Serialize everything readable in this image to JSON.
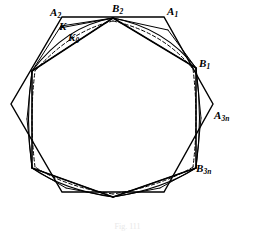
{
  "figure": {
    "caption": "Fig. 111",
    "background_color": "#ffffff",
    "stroke_color": "#000000",
    "labels": [
      {
        "id": "A2",
        "base": "A",
        "sub": "2",
        "x": 50,
        "y": 7,
        "name": "label-a2"
      },
      {
        "id": "B2",
        "base": "B",
        "sub": "2",
        "x": 112,
        "y": 3,
        "name": "label-b2"
      },
      {
        "id": "A1",
        "base": "A",
        "sub": "1",
        "x": 167,
        "y": 6,
        "name": "label-a1"
      },
      {
        "id": "K",
        "base": "K",
        "sub": "",
        "x": 59,
        "y": 21,
        "name": "label-k"
      },
      {
        "id": "K0",
        "base": "K",
        "sub": "0",
        "x": 68,
        "y": 32,
        "name": "label-k0"
      },
      {
        "id": "B1",
        "base": "B",
        "sub": "1",
        "x": 199,
        "y": 58,
        "name": "label-b1"
      },
      {
        "id": "A3n",
        "base": "A",
        "sub": "3n",
        "x": 214,
        "y": 110,
        "name": "label-a3n"
      },
      {
        "id": "B3n",
        "base": "B",
        "sub": "3n",
        "x": 196,
        "y": 163,
        "name": "label-b3n"
      }
    ],
    "outer_hexagon": {
      "name": "outer-hexagon-A",
      "points": "62,17 164,17 213,104 164,192 62,192 11,104",
      "stroke_width": 1.4
    },
    "inner_hexagon": {
      "name": "inner-hexagon-B",
      "points": "113,18 196,68 196,168 113,197 32,168 32,71",
      "stroke_width": 1.6
    },
    "arcs_outer": {
      "name": "curve-K",
      "stroke_width": 1.1,
      "paths": [
        "M113,18 Q66,26 32,71",
        "M113,18 Q165,28 196,68",
        "M196,68 Q203,118 196,168",
        "M196,168 Q163,189 113,197",
        "M113,197 Q64,190 32,168",
        "M32,168 Q25,119 32,71"
      ]
    },
    "arcs_inner": {
      "name": "curve-K0-dashed",
      "stroke_width": 1.0,
      "dash": "3.5,2.5",
      "paths": [
        "M113,21 Q70,31 35,71",
        "M113,21 Q163,32 193,69",
        "M193,69 Q199,118 193,167",
        "M193,167 Q161,186 113,194",
        "M113,194 Q66,187 35,167",
        "M35,167 Q29,119 35,71"
      ]
    },
    "chords": {
      "name": "chord-lines",
      "stroke_width": 1.0,
      "segments": [
        "M113,18 L61,26",
        "M61,26 L32,71",
        "M113,18 L60,28",
        "M113,18 L168,30",
        "M168,30 L196,68",
        "M196,168 L160,188",
        "M160,188 L113,197",
        "M113,197 L66,188",
        "M66,188 L32,168",
        "M196,68 L201,118",
        "M201,118 L196,168",
        "M32,71 L27,119",
        "M27,119 L32,168"
      ]
    },
    "apex_spokes": {
      "name": "apex-spoke-lines",
      "stroke_width": 1.0,
      "segments": [
        "M113,18 L32,71",
        "M113,18 L196,68",
        "M113,197 L32,168",
        "M113,197 L196,168"
      ]
    }
  }
}
